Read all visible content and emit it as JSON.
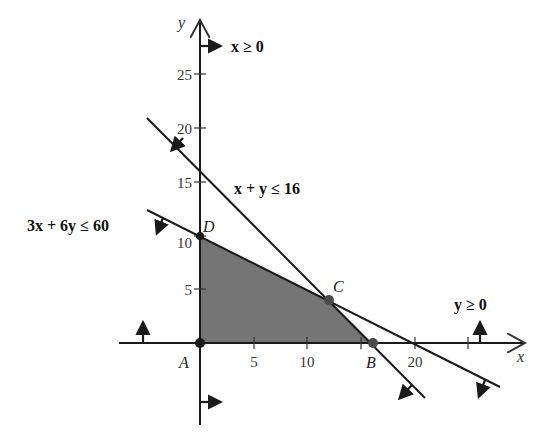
{
  "diagram": {
    "type": "linear-programming-feasible-region",
    "axes": {
      "x_label": "x",
      "y_label": "y",
      "x_ticks": [
        "5",
        "10",
        "20"
      ],
      "x_tick_values": [
        5,
        10,
        15,
        20,
        25
      ],
      "y_ticks": [
        "5",
        "10",
        "15",
        "20",
        "25"
      ]
    },
    "constraints": [
      {
        "id": "x_nonneg",
        "label": "x ≥ 0"
      },
      {
        "id": "y_nonneg",
        "label": "y ≥ 0"
      },
      {
        "id": "line1",
        "label": "x + y ≤ 16",
        "equation": "x + y = 16"
      },
      {
        "id": "line2",
        "label": "3x + 6y ≤ 60",
        "equation": "3x + 6y = 60"
      }
    ],
    "vertices": [
      {
        "label": "A",
        "x": 0,
        "y": 0
      },
      {
        "label": "B",
        "x": 16,
        "y": 0
      },
      {
        "label": "C",
        "x": 12,
        "y": 4
      },
      {
        "label": "D",
        "x": 0,
        "y": 10
      }
    ],
    "colors": {
      "feasible_region": "#6e6e6e",
      "lines": "#1a1a1a",
      "vertex": "#1a1a1a"
    }
  }
}
